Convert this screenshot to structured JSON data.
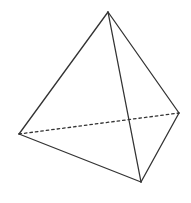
{
  "diagram": {
    "type": "tetrahedron",
    "stroke_color": "#333333",
    "background": "#ffffff",
    "vertices": {
      "apex": [
        108,
        12
      ],
      "left": [
        19,
        134
      ],
      "right": [
        179,
        113
      ],
      "bottom": [
        141,
        182
      ]
    },
    "edges": [
      {
        "from": "apex",
        "to": "left",
        "style": "solid"
      },
      {
        "from": "apex",
        "to": "right",
        "style": "solid"
      },
      {
        "from": "apex",
        "to": "bottom",
        "style": "solid"
      },
      {
        "from": "left",
        "to": "bottom",
        "style": "solid"
      },
      {
        "from": "right",
        "to": "bottom",
        "style": "solid"
      },
      {
        "from": "left",
        "to": "right",
        "style": "dashed"
      }
    ]
  }
}
